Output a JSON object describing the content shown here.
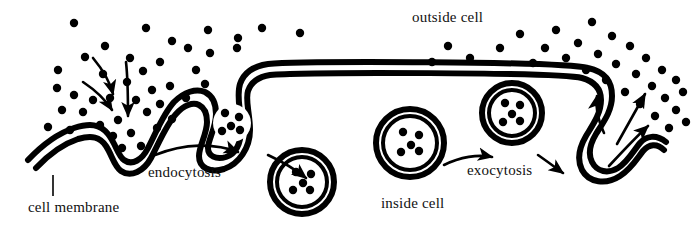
{
  "diagram": {
    "labels": {
      "outside_cell": "outside cell",
      "inside_cell": "inside cell",
      "endocytosis": "endocytosis",
      "exocytosis": "exocytosis",
      "cell_membrane": "cell membrane"
    },
    "colors": {
      "stroke": "#000000",
      "background": "#ffffff",
      "particle": "#000000",
      "text": "#111111"
    },
    "style": {
      "membrane_outer_width": 6,
      "membrane_inner_width": 3,
      "membrane_gap": 5
    },
    "membrane": {
      "name": "cell-membrane",
      "description": "double-line membrane with endocytosis invagination at left and exocytosis pocket at right",
      "outer_path": "M 28,160 C 46,141 62,132 74,128 C 90,123 100,124 108,134 C 116,144 118,156 124,160 C 132,166 142,160 148,148 C 156,133 163,114 174,102 C 184,92 196,88 205,92 C 213,96 216,104 216,114 C 216,128 208,140 208,148 C 208,156 216,160 226,157 C 238,153 241,140 241,128 C 241,110 236,96 240,84 C 244,72 254,66 268,64 C 300,61 560,61 588,68 C 606,72 612,82 612,96 C 612,112 602,124 596,134 C 590,144 588,154 592,162 C 597,172 608,174 618,168 C 628,162 634,150 640,143 C 646,136 656,134 666,142",
      "inner_path": "M 36,168 C 52,151 66,143 78,139 C 92,135 100,137 106,146 C 112,155 114,166 121,171 C 131,178 144,171 151,158 C 159,143 166,125 176,114 C 184,105 193,102 199,105 C 205,108 207,114 207,122 C 207,134 199,146 199,156 C 199,168 210,173 224,169 C 239,164 250,148 250,130 C 250,114 245,100 248,91 C 251,82 258,77 270,75 C 302,72 558,72 582,78 C 596,82 601,90 601,100 C 601,114 592,126 586,136 C 579,148 577,160 582,170 C 589,183 606,185 620,176 C 632,168 638,157 643,151 C 649,144 657,143 664,150",
      "pockets": [
        {
          "name": "endocytosis-pocket",
          "outer_path": "M 216,114 C 216,128 208,140 208,148 C 208,156 216,160 226,157 C 238,153 241,140 241,128",
          "description": "invaginated pocket forming a vesicle at the left membrane"
        }
      ]
    },
    "vesicles": [
      {
        "name": "budding-vesicle",
        "stage": "forming",
        "cx": 232,
        "cy": 123,
        "r_outer": 26,
        "r_inner": 19,
        "particle_count": 5,
        "particles": [
          {
            "x": 225,
            "y": 113
          },
          {
            "x": 239,
            "y": 117
          },
          {
            "x": 231,
            "y": 126
          },
          {
            "x": 222,
            "y": 131
          },
          {
            "x": 240,
            "y": 130
          }
        ],
        "note": "drawn as part of the membrane invagination"
      },
      {
        "name": "free-vesicle-left",
        "stage": "internalized",
        "cx": 302,
        "cy": 182,
        "r_outer": 32,
        "r_inner": 25,
        "particle_count": 5,
        "particles": [
          {
            "x": 296,
            "y": 172
          },
          {
            "x": 311,
            "y": 174
          },
          {
            "x": 303,
            "y": 183
          },
          {
            "x": 293,
            "y": 190
          },
          {
            "x": 310,
            "y": 190
          }
        ]
      },
      {
        "name": "free-vesicle-right",
        "stage": "internalized",
        "cx": 410,
        "cy": 143,
        "r_outer": 34,
        "r_inner": 27,
        "particle_count": 5,
        "particles": [
          {
            "x": 403,
            "y": 132
          },
          {
            "x": 419,
            "y": 135
          },
          {
            "x": 411,
            "y": 145
          },
          {
            "x": 401,
            "y": 152
          },
          {
            "x": 419,
            "y": 151
          }
        ]
      },
      {
        "name": "fusing-vesicle",
        "stage": "fusing",
        "cx": 512,
        "cy": 113,
        "r_outer": 30,
        "r_inner": 23,
        "particle_count": 5,
        "particles": [
          {
            "x": 505,
            "y": 103
          },
          {
            "x": 520,
            "y": 105
          },
          {
            "x": 512,
            "y": 114
          },
          {
            "x": 503,
            "y": 122
          },
          {
            "x": 520,
            "y": 121
          }
        ]
      }
    ],
    "arrows": {
      "endocytosis_intake": [
        {
          "name": "intake-arrow-1",
          "path": "M 93,58 C 103,70 110,82 113,94",
          "curved": true
        },
        {
          "name": "intake-arrow-2",
          "path": "M 83,82 C 95,90 105,99 112,110",
          "curved": true
        },
        {
          "name": "intake-arrow-3",
          "path": "M 126,62 C 128,80 128,98 128,116",
          "curved": true
        }
      ],
      "process_flow": [
        {
          "name": "endocytosis-arrow-straight",
          "path": "M 155,155 C 185,143 215,143 238,152",
          "curved": true
        },
        {
          "name": "endocytosis-arrow-curved",
          "path": "M 268,155 C 283,162 296,170 306,178",
          "curved": true
        },
        {
          "name": "exocytosis-arrow-straight",
          "path": "M 444,165 C 460,157 478,154 492,157",
          "curved": true
        },
        {
          "name": "exocytosis-arrow-curved",
          "path": "M 538,155 C 548,162 556,168 563,173",
          "curved": true
        }
      ],
      "exocytosis_release": [
        {
          "name": "release-arrow-1",
          "path": "M 604,133 C 598,120 595,108 597,96",
          "curved": true
        },
        {
          "name": "release-arrow-2",
          "path": "M 617,144 C 626,128 636,110 645,94",
          "curved": true
        },
        {
          "name": "release-arrow-3",
          "path": "M 609,166 C 622,152 635,138 648,126",
          "curved": true
        }
      ]
    },
    "particles": {
      "name": "extracellular-particles",
      "radius": 4.2,
      "outside_left_cluster": [
        {
          "x": 74,
          "y": 23
        },
        {
          "x": 105,
          "y": 46
        },
        {
          "x": 146,
          "y": 28
        },
        {
          "x": 58,
          "y": 70
        },
        {
          "x": 85,
          "y": 57
        },
        {
          "x": 172,
          "y": 41
        },
        {
          "x": 57,
          "y": 88
        },
        {
          "x": 103,
          "y": 74
        },
        {
          "x": 130,
          "y": 58
        },
        {
          "x": 74,
          "y": 95
        },
        {
          "x": 93,
          "y": 100
        },
        {
          "x": 127,
          "y": 82
        },
        {
          "x": 62,
          "y": 110
        },
        {
          "x": 83,
          "y": 112
        },
        {
          "x": 110,
          "y": 98
        },
        {
          "x": 143,
          "y": 71
        },
        {
          "x": 160,
          "y": 62
        },
        {
          "x": 188,
          "y": 48
        },
        {
          "x": 100,
          "y": 125
        },
        {
          "x": 118,
          "y": 120
        },
        {
          "x": 136,
          "y": 100
        },
        {
          "x": 48,
          "y": 127
        },
        {
          "x": 70,
          "y": 130
        },
        {
          "x": 152,
          "y": 90
        },
        {
          "x": 113,
          "y": 136
        },
        {
          "x": 131,
          "y": 133
        },
        {
          "x": 147,
          "y": 112
        },
        {
          "x": 160,
          "y": 104
        },
        {
          "x": 170,
          "y": 86
        },
        {
          "x": 196,
          "y": 70
        },
        {
          "x": 122,
          "y": 148
        },
        {
          "x": 141,
          "y": 146
        },
        {
          "x": 157,
          "y": 128
        },
        {
          "x": 172,
          "y": 119
        },
        {
          "x": 186,
          "y": 98
        },
        {
          "x": 205,
          "y": 84
        },
        {
          "x": 208,
          "y": 30
        },
        {
          "x": 238,
          "y": 38
        },
        {
          "x": 262,
          "y": 28
        },
        {
          "x": 300,
          "y": 33
        },
        {
          "x": 210,
          "y": 53
        },
        {
          "x": 237,
          "y": 48
        }
      ],
      "outside_right_cluster": [
        {
          "x": 520,
          "y": 34
        },
        {
          "x": 556,
          "y": 30
        },
        {
          "x": 592,
          "y": 22
        },
        {
          "x": 545,
          "y": 48
        },
        {
          "x": 578,
          "y": 43
        },
        {
          "x": 612,
          "y": 36
        },
        {
          "x": 566,
          "y": 58
        },
        {
          "x": 598,
          "y": 54
        },
        {
          "x": 630,
          "y": 46
        },
        {
          "x": 586,
          "y": 70
        },
        {
          "x": 616,
          "y": 64
        },
        {
          "x": 646,
          "y": 58
        },
        {
          "x": 533,
          "y": 63
        },
        {
          "x": 606,
          "y": 80
        },
        {
          "x": 636,
          "y": 74
        },
        {
          "x": 662,
          "y": 70
        },
        {
          "x": 625,
          "y": 92
        },
        {
          "x": 652,
          "y": 86
        },
        {
          "x": 676,
          "y": 80
        },
        {
          "x": 640,
          "y": 104
        },
        {
          "x": 665,
          "y": 98
        },
        {
          "x": 683,
          "y": 92
        },
        {
          "x": 655,
          "y": 116
        },
        {
          "x": 676,
          "y": 110
        },
        {
          "x": 669,
          "y": 128
        },
        {
          "x": 686,
          "y": 122
        },
        {
          "x": 500,
          "y": 48
        },
        {
          "x": 470,
          "y": 58
        },
        {
          "x": 448,
          "y": 46
        },
        {
          "x": 432,
          "y": 62
        }
      ]
    },
    "leader_line": {
      "name": "cell-membrane-leader",
      "path": "M 53,175 L 53,196"
    }
  }
}
